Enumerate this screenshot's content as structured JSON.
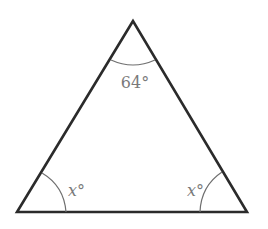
{
  "diagram": {
    "type": "triangle",
    "vertices": {
      "apex": {
        "x": 133,
        "y": 21
      },
      "bottom_left": {
        "x": 17,
        "y": 212
      },
      "bottom_right": {
        "x": 247,
        "y": 212
      }
    },
    "angles": {
      "apex": {
        "label": "64°",
        "value": 64
      },
      "bottom_left": {
        "label": "x°",
        "variable": "x"
      },
      "bottom_right": {
        "label": "x°",
        "variable": "x"
      }
    },
    "colors": {
      "sides": "#2b2b2b",
      "arcs": "#6f6f6f",
      "labels": "#7a7a7a",
      "background": "#ffffff"
    }
  }
}
